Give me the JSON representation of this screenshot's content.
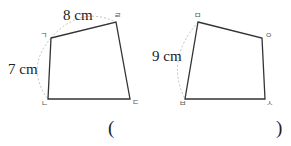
{
  "figures": [
    {
      "id": "left-quadrilateral",
      "vertices": [
        {
          "label": "ㄱ",
          "x": 51,
          "y": 38
        },
        {
          "label": "ㄹ",
          "x": 116,
          "y": 22
        },
        {
          "label": "ㄷ",
          "x": 130,
          "y": 99
        },
        {
          "label": "ㄴ",
          "x": 48,
          "y": 99
        }
      ],
      "measurements": [
        {
          "side": "ㄱㄹ",
          "text": "8 cm"
        },
        {
          "side": "ㄱㄴ",
          "text": "7 cm"
        }
      ]
    },
    {
      "id": "right-quadrilateral",
      "vertices": [
        {
          "label": "ㅁ",
          "x": 198,
          "y": 22
        },
        {
          "label": "ㅇ",
          "x": 262,
          "y": 38
        },
        {
          "label": "ㅅ",
          "x": 265,
          "y": 99
        },
        {
          "label": "ㅂ",
          "x": 185,
          "y": 99
        }
      ],
      "measurements": [
        {
          "side": "ㅁㅂ",
          "text": "9 cm"
        }
      ]
    }
  ],
  "answer_blank": {
    "open": "(",
    "close": ")"
  },
  "colors": {
    "stroke": "#333333",
    "dashed_arc": "#b8b8b8",
    "text": "#222222"
  }
}
